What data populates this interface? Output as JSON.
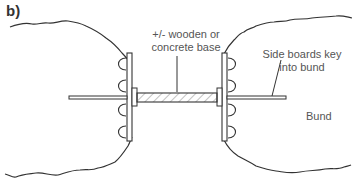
{
  "figure": {
    "panel_label": "b)",
    "annotations": {
      "base": [
        "+/- wooden or",
        "concrete base"
      ],
      "side_boards": [
        "Side boards key",
        "into bund"
      ],
      "bund": "Bund"
    },
    "colors": {
      "line": "#333333",
      "text": "#555555",
      "hatch": "#999999"
    }
  }
}
